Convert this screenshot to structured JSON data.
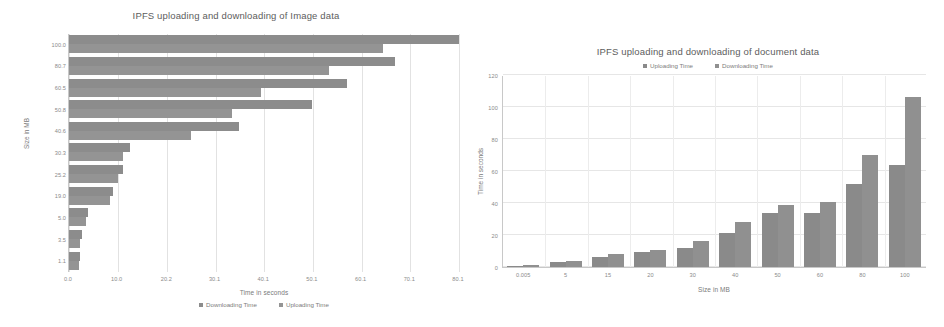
{
  "chart_data": [
    {
      "type": "bar",
      "orientation": "horizontal",
      "title": "IPFS uploading and downloading of Image data",
      "xlabel": "Time in seconds",
      "ylabel": "Size in MB",
      "xlim": [
        0,
        80
      ],
      "ylim": null,
      "grid": true,
      "legend_position": "bottom",
      "xticks": [
        "0.0",
        "10.0",
        "20.2",
        "30.1",
        "40.1",
        "50.1",
        "60.1",
        "70.1",
        "80.1"
      ],
      "xtick_values": [
        0,
        10,
        20.2,
        30.1,
        40.1,
        50.1,
        60.1,
        70.1,
        80.1
      ],
      "categories": [
        "100.0",
        "80.7",
        "60.5",
        "50.8",
        "40.6",
        "30.3",
        "25.2",
        "19.0",
        "5.0",
        "3.5",
        "1.1"
      ],
      "series": [
        {
          "name": "Downloading Time",
          "values": [
            80.1,
            67.0,
            57.0,
            50.0,
            35.0,
            12.5,
            11.0,
            9.0,
            3.8,
            2.6,
            2.2
          ]
        },
        {
          "name": "Uploading Time",
          "values": [
            64.5,
            53.5,
            39.5,
            33.5,
            25.0,
            11.0,
            10.0,
            8.5,
            3.4,
            2.3,
            2.0
          ]
        }
      ]
    },
    {
      "type": "bar",
      "orientation": "vertical",
      "title": "IPFS uploading and downloading of document data",
      "xlabel": "Size in MB",
      "ylabel": "Time in seconds",
      "ylim": [
        0,
        120
      ],
      "grid": true,
      "legend_position": "top",
      "yticks": [
        "0",
        "20",
        "40",
        "60",
        "80",
        "100",
        "120"
      ],
      "ytick_values": [
        0,
        20,
        40,
        60,
        80,
        100,
        120
      ],
      "categories": [
        "0.005",
        "5",
        "15",
        "20",
        "30",
        "40",
        "50",
        "60",
        "80",
        "100"
      ],
      "series": [
        {
          "name": "Uploading Time",
          "values": [
            0.4,
            3.3,
            6.5,
            9.5,
            12.0,
            21.0,
            33.5,
            33.5,
            52.0,
            64.0
          ]
        },
        {
          "name": "Downloading Time",
          "values": [
            1.2,
            4.0,
            8.0,
            10.5,
            16.5,
            28.0,
            38.5,
            40.5,
            70.0,
            106.0
          ]
        }
      ]
    }
  ],
  "left_chart": {
    "title": "IPFS uploading and downloading of Image data",
    "x_axis_title": "Time in seconds",
    "y_axis_title": "Size in MB",
    "legend": [
      {
        "label": "Downloading Time",
        "color": "#8c8c8c"
      },
      {
        "label": "Uploading Time",
        "color": "#949494"
      }
    ]
  },
  "right_chart": {
    "title": "IPFS uploading and downloading of document data",
    "x_axis_title": "Size in MB",
    "y_axis_title": "Time in seconds",
    "legend": [
      {
        "label": "Uploading Time",
        "color": "#8a8a8a"
      },
      {
        "label": "Downloading Time",
        "color": "#909090"
      }
    ]
  },
  "colors": {
    "bar": "#8c8c8c",
    "grid": "#e4e4e4",
    "axis": "#c8c8c8",
    "text": "#7a7a7a",
    "background": "#ffffff"
  }
}
